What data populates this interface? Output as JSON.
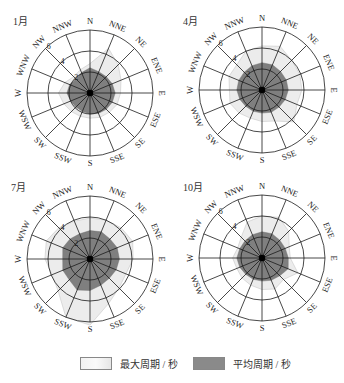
{
  "chart_data": [
    {
      "type": "radar",
      "title": "1月",
      "directions": [
        "N",
        "NNE",
        "NE",
        "ENE",
        "E",
        "ESE",
        "SE",
        "SSE",
        "S",
        "SSW",
        "SW",
        "WSW",
        "W",
        "WNW",
        "NW",
        "NNW"
      ],
      "rings": [
        2,
        4,
        6
      ],
      "rmax": 6,
      "series": [
        {
          "name": "最大周期 / 秒",
          "values": [
            2.8,
            4.6,
            3.8,
            3.2,
            2.9,
            2.8,
            2.6,
            2.5,
            2.4,
            2.4,
            2.5,
            2.7,
            3.0,
            2.6,
            2.2,
            2.4
          ]
        },
        {
          "name": "平均周期 / 秒",
          "values": [
            2.4,
            2.2,
            2.2,
            2.3,
            2.4,
            2.3,
            2.2,
            2.1,
            2.0,
            1.9,
            1.9,
            2.0,
            2.2,
            2.1,
            1.9,
            2.1
          ]
        }
      ]
    },
    {
      "type": "radar",
      "title": "4月",
      "directions": [
        "N",
        "NNE",
        "NE",
        "ENE",
        "E",
        "ESE",
        "SE",
        "SSE",
        "S",
        "SSW",
        "SW",
        "WSW",
        "W",
        "WNW",
        "NW",
        "NNW"
      ],
      "rings": [
        2,
        4,
        6
      ],
      "rmax": 6,
      "series": [
        {
          "name": "最大周期 / 秒",
          "values": [
            4.2,
            4.5,
            4.0,
            3.9,
            3.8,
            3.6,
            4.3,
            3.2,
            3.0,
            2.9,
            3.1,
            3.3,
            3.1,
            3.4,
            3.4,
            4.0
          ]
        },
        {
          "name": "平均周期 / 秒",
          "values": [
            2.6,
            2.6,
            2.5,
            2.5,
            2.5,
            2.4,
            2.3,
            2.3,
            2.2,
            2.2,
            2.2,
            2.3,
            2.4,
            2.4,
            2.4,
            2.5
          ]
        }
      ]
    },
    {
      "type": "radar",
      "title": "7月",
      "directions": [
        "N",
        "NNE",
        "NE",
        "ENE",
        "E",
        "ESE",
        "SE",
        "SSE",
        "S",
        "SSW",
        "SW",
        "WSW",
        "W",
        "WNW",
        "NW",
        "NNW"
      ],
      "rings": [
        2,
        4,
        6
      ],
      "rmax": 6,
      "series": [
        {
          "name": "最大周期 / 秒",
          "values": [
            3.9,
            4.0,
            4.2,
            4.4,
            4.1,
            3.7,
            3.9,
            4.6,
            6.3,
            6.0,
            4.3,
            3.9,
            4.3,
            4.5,
            4.2,
            3.9
          ]
        },
        {
          "name": "平均周期 / 秒",
          "values": [
            2.7,
            2.8,
            2.7,
            2.8,
            2.8,
            2.7,
            2.6,
            2.7,
            3.0,
            3.2,
            2.8,
            2.8,
            2.6,
            2.8,
            2.7,
            2.6
          ]
        }
      ]
    },
    {
      "type": "radar",
      "title": "10月",
      "directions": [
        "N",
        "NNE",
        "NE",
        "ENE",
        "E",
        "ESE",
        "SE",
        "SSE",
        "S",
        "SSW",
        "SW",
        "WSW",
        "W",
        "WNW",
        "NW",
        "NNW"
      ],
      "rings": [
        2,
        4,
        6
      ],
      "rmax": 6,
      "series": [
        {
          "name": "最大周期 / 秒",
          "values": [
            4.0,
            4.2,
            3.6,
            2.8,
            2.7,
            3.7,
            2.9,
            3.2,
            3.0,
            2.8,
            2.7,
            2.6,
            2.8,
            2.5,
            2.8,
            3.7
          ]
        },
        {
          "name": "平均周期 / 秒",
          "values": [
            2.5,
            2.5,
            2.4,
            2.4,
            2.5,
            2.7,
            2.4,
            2.3,
            2.2,
            2.2,
            2.2,
            2.3,
            2.4,
            2.3,
            2.3,
            2.4
          ]
        }
      ]
    }
  ],
  "panels": [
    {
      "month": "1月"
    },
    {
      "month": "4月"
    },
    {
      "month": "7月"
    },
    {
      "month": "10月"
    }
  ],
  "legend": {
    "max_label": "最大周期 / 秒",
    "avg_label": "平均周期 / 秒"
  },
  "colors": {
    "max_fill": "#ececec",
    "avg_fill": "#7f7f7f",
    "grid": "#1a1a1a"
  }
}
